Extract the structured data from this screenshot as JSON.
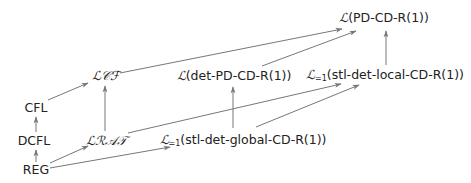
{
  "diagram": {
    "type": "inclusion-hierarchy",
    "nodes": [
      {
        "id": "pdcdr1",
        "calL": "ℒ",
        "sub": "",
        "text": "(PD-CD-R(1))",
        "x": 384,
        "y": 18
      },
      {
        "id": "lcf",
        "calL": "ℒ𝒞ℱ",
        "sub": "",
        "text": "",
        "x": 106,
        "y": 76
      },
      {
        "id": "detpd",
        "calL": "ℒ",
        "sub": "",
        "text": "(det-PD-CD-R(1))",
        "x": 234,
        "y": 76
      },
      {
        "id": "stllocal",
        "calL": "ℒ",
        "sub": "=1",
        "text": "(stl-det-local-CD-R(1))",
        "x": 385,
        "y": 76
      },
      {
        "id": "cfl",
        "calL": "",
        "sub": "",
        "text": "CFL",
        "x": 36,
        "y": 108
      },
      {
        "id": "dcfl",
        "calL": "",
        "sub": "",
        "text": "DCFL",
        "x": 34,
        "y": 141
      },
      {
        "id": "lrat",
        "calL": "ℒℛ𝒜𝒯",
        "sub": "",
        "text": "",
        "x": 106,
        "y": 141
      },
      {
        "id": "stlglobal",
        "calL": "ℒ",
        "sub": "=1",
        "text": "(stl-det-global-CD-R(1))",
        "x": 243,
        "y": 141
      },
      {
        "id": "reg",
        "calL": "",
        "sub": "",
        "text": "REG",
        "x": 36,
        "y": 170
      }
    ],
    "edges": [
      {
        "from": "reg",
        "to": "dcfl",
        "x1": 36,
        "y1": 162,
        "x2": 36,
        "y2": 150
      },
      {
        "from": "dcfl",
        "to": "cfl",
        "x1": 36,
        "y1": 132,
        "x2": 36,
        "y2": 117
      },
      {
        "from": "cfl",
        "to": "lcf",
        "x1": 48,
        "y1": 100,
        "x2": 88,
        "y2": 83
      },
      {
        "from": "lrat",
        "to": "lcf",
        "x1": 105,
        "y1": 131,
        "x2": 105,
        "y2": 86
      },
      {
        "from": "reg",
        "to": "lrat",
        "x1": 50,
        "y1": 163,
        "x2": 88,
        "y2": 146
      },
      {
        "from": "reg",
        "to": "stlglobal",
        "x1": 50,
        "y1": 168,
        "x2": 170,
        "y2": 147
      },
      {
        "from": "lcf",
        "to": "pdcdr1",
        "x1": 120,
        "y1": 73,
        "x2": 342,
        "y2": 29
      },
      {
        "from": "detpd",
        "to": "pdcdr1",
        "x1": 262,
        "y1": 66,
        "x2": 356,
        "y2": 31
      },
      {
        "from": "stlglobal",
        "to": "detpd",
        "x1": 233,
        "y1": 128,
        "x2": 233,
        "y2": 87
      },
      {
        "from": "lrat",
        "to": "stllocal",
        "x1": 128,
        "y1": 133,
        "x2": 341,
        "y2": 84
      },
      {
        "from": "stlglobal",
        "to": "stllocal",
        "x1": 256,
        "y1": 127,
        "x2": 359,
        "y2": 85
      },
      {
        "from": "stllocal",
        "to": "pdcdr1",
        "x1": 386,
        "y1": 65,
        "x2": 386,
        "y2": 31
      }
    ],
    "colors": {
      "line": "#777777",
      "text": "#222222",
      "background": "#ffffff"
    }
  }
}
